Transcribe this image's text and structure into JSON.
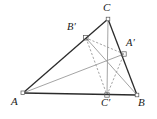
{
  "figure": {
    "background_color": "#ffffff",
    "width": 157,
    "height": 119,
    "stroke_dark": "#2b2b2b",
    "stroke_mid": "#7a7a7a",
    "stroke_light": "#9a9a9a",
    "dash_color": "#8d8d8d",
    "vertex_marker_color": "#555555"
  },
  "labels": {
    "A": "A",
    "B": "B",
    "C": "C",
    "A_prime": "A′",
    "B_prime": "B′",
    "C_prime": "C′"
  },
  "points": {
    "A": {
      "x": 23,
      "y": 93,
      "label": "A",
      "label_x": 11,
      "label_y": 96
    },
    "B": {
      "x": 137,
      "y": 95,
      "label": "B",
      "label_x": 138,
      "label_y": 97
    },
    "C": {
      "x": 108,
      "y": 19,
      "label": "C",
      "label_x": 103,
      "label_y": 2
    },
    "A_prime": {
      "x": 124,
      "y": 54,
      "label": "A′",
      "label_x": 126,
      "label_y": 37
    },
    "B_prime": {
      "x": 86,
      "y": 38,
      "label": "B′",
      "label_x": 67,
      "label_y": 21
    },
    "C_prime": {
      "x": 107,
      "y": 95,
      "label": "C′",
      "label_x": 101,
      "label_y": 97
    },
    "orthocenter": {
      "x": 107,
      "y": 62
    }
  },
  "segments": [
    {
      "name": "side-AB",
      "from": "A",
      "to": "B",
      "style": "solid",
      "weight": "dark"
    },
    {
      "name": "side-AC",
      "from": "A",
      "to": "C",
      "style": "solid",
      "weight": "dark"
    },
    {
      "name": "side-BC",
      "from": "B",
      "to": "C",
      "style": "solid",
      "weight": "dark"
    },
    {
      "name": "altitude-from-A",
      "from": "A",
      "to": "A_prime",
      "style": "solid",
      "weight": "light"
    },
    {
      "name": "altitude-from-B",
      "from": "B",
      "to": "B_prime",
      "style": "solid",
      "weight": "light"
    },
    {
      "name": "altitude-from-C",
      "from": "C",
      "to": "C_prime",
      "style": "solid",
      "weight": "light"
    },
    {
      "name": "orthic-side-ApBp",
      "from": "A_prime",
      "to": "B_prime",
      "style": "dashed",
      "weight": "dash"
    },
    {
      "name": "orthic-side-BpCp",
      "from": "B_prime",
      "to": "C_prime",
      "style": "dashed",
      "weight": "dash"
    },
    {
      "name": "orthic-side-CpAp",
      "from": "C_prime",
      "to": "A_prime",
      "style": "dashed",
      "weight": "dash"
    }
  ],
  "right_angle_markers": [
    {
      "name": "right-angle-at-B-prime",
      "x": 86,
      "y": 38
    },
    {
      "name": "right-angle-at-A-prime",
      "x": 124,
      "y": 54
    },
    {
      "name": "right-angle-at-C-prime",
      "x": 107,
      "y": 95
    }
  ]
}
